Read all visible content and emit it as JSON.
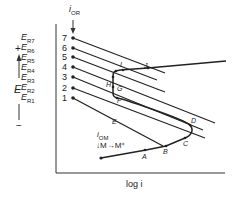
{
  "diagram": {
    "x_axis_label": "log i",
    "y_axis_label": "E",
    "y_axis_plus": "+",
    "y_axis_minus": "−",
    "top_arrow_label": "i",
    "top_arrow_sub": "OR",
    "bottom_arrow_label": "i",
    "bottom_arrow_sub": "OM",
    "reaction": "M→M⁺",
    "potentials": [
      {
        "label": "E",
        "sub": "R7",
        "num": "7"
      },
      {
        "label": "E",
        "sub": "R6",
        "num": "6"
      },
      {
        "label": "E",
        "sub": "R5",
        "num": "5"
      },
      {
        "label": "E",
        "sub": "R4",
        "num": "4"
      },
      {
        "label": "E",
        "sub": "R3",
        "num": "3"
      },
      {
        "label": "E",
        "sub": "R2",
        "num": "2"
      },
      {
        "label": "E",
        "sub": "R1",
        "num": "1"
      }
    ],
    "points": [
      "A",
      "B",
      "C",
      "D",
      "E",
      "F",
      "G",
      "H",
      "I",
      "J"
    ]
  }
}
